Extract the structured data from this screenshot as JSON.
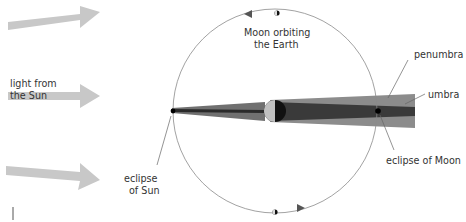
{
  "labels": {
    "light_line1": "light from",
    "light_line2": "the Sun",
    "moon_line1": "Moon orbiting",
    "moon_line2": "the Earth",
    "penumbra": "penumbra",
    "umbra": "umbra",
    "eclipse_moon": "eclipse of Moon",
    "eclipse_sun_line1": "eclipse",
    "eclipse_sun_line2": "of Sun"
  },
  "colors": {
    "sunlight_arrow": "#c8c8c8",
    "orbit": "#8a8a8a",
    "penumbra": "#8c8c8c",
    "umbra": "#3a3a3a",
    "earth_lit": "#c0c0c0",
    "earth_dark": "#111111",
    "moon_shadow_cone": "#555555"
  }
}
